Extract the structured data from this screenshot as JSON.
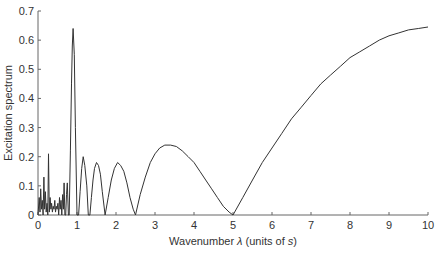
{
  "chart_data": {
    "type": "line",
    "title": "",
    "xlabel": "Wavenumber λ (units of s)",
    "xlabel_parts": {
      "pre": "Wavenumber ",
      "symbol": "λ",
      "mid": " (units of ",
      "unit": "s",
      "post": ")"
    },
    "ylabel": "Excitation spectrum",
    "xlim": [
      0,
      10
    ],
    "ylim": [
      0,
      0.7
    ],
    "grid": false,
    "legend": null,
    "x_ticks": [
      0,
      1,
      2,
      3,
      4,
      5,
      6,
      7,
      8,
      9,
      10
    ],
    "x_tick_labels": [
      "0",
      "1",
      "2",
      "3",
      "4",
      "5",
      "6",
      "7",
      "8",
      "9",
      "10"
    ],
    "y_ticks": [
      0,
      0.1,
      0.2,
      0.3,
      0.4,
      0.5,
      0.6,
      0.7
    ],
    "y_tick_labels": [
      "0",
      "0.1",
      "0.2",
      "0.3",
      "0.4",
      "0.5",
      "0.6",
      "0.7"
    ],
    "line_color": "#333333",
    "series": [
      {
        "name": "Excitation spectrum",
        "x": [
          0.0,
          0.03,
          0.05,
          0.07,
          0.09,
          0.11,
          0.13,
          0.15,
          0.17,
          0.19,
          0.21,
          0.23,
          0.25,
          0.27,
          0.29,
          0.31,
          0.33,
          0.35,
          0.37,
          0.39,
          0.41,
          0.43,
          0.45,
          0.47,
          0.49,
          0.51,
          0.53,
          0.55,
          0.57,
          0.59,
          0.61,
          0.63,
          0.65,
          0.67,
          0.69,
          0.71,
          0.73,
          0.75,
          0.78,
          0.8,
          0.83,
          0.86,
          0.88,
          0.9,
          0.93,
          0.96,
          1.0,
          1.04,
          1.08,
          1.12,
          1.16,
          1.2,
          1.25,
          1.29,
          1.33,
          1.37,
          1.41,
          1.45,
          1.5,
          1.55,
          1.6,
          1.65,
          1.72,
          1.8,
          1.88,
          1.96,
          2.04,
          2.12,
          2.2,
          2.28,
          2.36,
          2.44,
          2.5,
          2.62,
          2.75,
          2.88,
          3.0,
          3.12,
          3.25,
          3.4,
          3.55,
          3.7,
          3.85,
          4.0,
          4.15,
          4.3,
          4.45,
          4.6,
          4.75,
          4.9,
          5.0,
          5.25,
          5.5,
          5.75,
          6.0,
          6.25,
          6.5,
          6.75,
          7.0,
          7.25,
          7.5,
          7.75,
          8.0,
          8.25,
          8.5,
          8.75,
          9.0,
          9.25,
          9.5,
          9.75,
          10.0
        ],
        "y": [
          0.0,
          0.06,
          0.01,
          0.09,
          0.02,
          0.05,
          0.0,
          0.13,
          0.02,
          0.08,
          0.01,
          0.04,
          0.0,
          0.21,
          0.01,
          0.06,
          0.02,
          0.04,
          0.01,
          0.03,
          0.02,
          0.05,
          0.01,
          0.03,
          0.02,
          0.04,
          0.0,
          0.06,
          0.02,
          0.05,
          0.0,
          0.07,
          0.02,
          0.11,
          0.0,
          0.0,
          0.07,
          0.11,
          0.0,
          0.0,
          0.22,
          0.45,
          0.58,
          0.64,
          0.55,
          0.3,
          0.0,
          0.0,
          0.08,
          0.16,
          0.2,
          0.17,
          0.1,
          0.0,
          0.0,
          0.06,
          0.12,
          0.16,
          0.18,
          0.17,
          0.14,
          0.08,
          0.0,
          0.06,
          0.12,
          0.16,
          0.18,
          0.17,
          0.15,
          0.11,
          0.06,
          0.02,
          0.0,
          0.07,
          0.13,
          0.18,
          0.21,
          0.23,
          0.24,
          0.24,
          0.235,
          0.22,
          0.2,
          0.18,
          0.15,
          0.12,
          0.09,
          0.06,
          0.03,
          0.01,
          0.0,
          0.06,
          0.12,
          0.18,
          0.23,
          0.28,
          0.33,
          0.37,
          0.41,
          0.45,
          0.48,
          0.51,
          0.54,
          0.56,
          0.58,
          0.6,
          0.615,
          0.625,
          0.635,
          0.64,
          0.645
        ]
      }
    ]
  }
}
